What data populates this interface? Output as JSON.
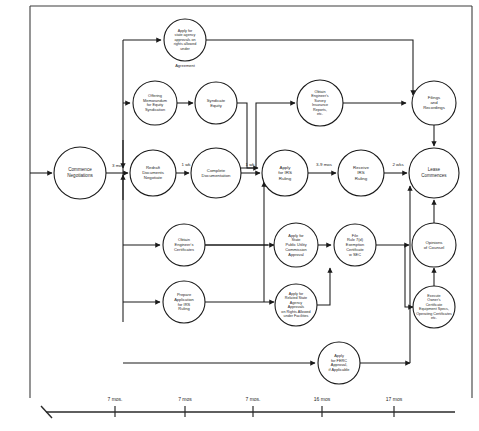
{
  "diagram": {
    "type": "flowchart",
    "nodes": [
      {
        "id": "commence",
        "label": [
          "Commence",
          "Negotiations"
        ],
        "cx": 80,
        "cy": 173,
        "r": 26,
        "font": 4.6
      },
      {
        "id": "redraft",
        "label": [
          "Redraft",
          "Documents",
          "Negotiate"
        ],
        "cx": 153,
        "cy": 173,
        "r": 23,
        "font": 4.3
      },
      {
        "id": "complete_doc",
        "label": [
          "Complete",
          "Documentation"
        ],
        "cx": 216,
        "cy": 173,
        "r": 25,
        "font": 4.3
      },
      {
        "id": "apply_irs",
        "label": [
          "Apply",
          "for IRS",
          "Ruling"
        ],
        "cx": 285,
        "cy": 173,
        "r": 23,
        "font": 4.4
      },
      {
        "id": "receive_irs",
        "label": [
          "Receive",
          "IRS",
          "Ruling"
        ],
        "cx": 361,
        "cy": 173,
        "r": 23,
        "font": 4.4
      },
      {
        "id": "lease_commences",
        "label": [
          "Lease",
          "Commences"
        ],
        "cx": 434,
        "cy": 173,
        "r": 25,
        "font": 4.5
      },
      {
        "id": "state_agency_agreement",
        "label": [
          "Apply for",
          "state agency",
          "approvals on",
          "rights allowed",
          "under"
        ],
        "sublabel": "Agreement",
        "cx": 185,
        "cy": 40,
        "r": 21,
        "font": 3.7
      },
      {
        "id": "offering_memo",
        "label": [
          "Offering",
          "Memorandum",
          "for Equity",
          "Syndication"
        ],
        "cx": 155,
        "cy": 103,
        "r": 22,
        "font": 3.9
      },
      {
        "id": "syndicate_equity",
        "label": [
          "Syndicate",
          "Equity"
        ],
        "cx": 216,
        "cy": 103,
        "r": 21,
        "font": 4.2
      },
      {
        "id": "engineers_survey",
        "label": [
          "Obtain",
          "Engineer's",
          "Survey",
          "Insurance",
          "Reports,",
          "etc."
        ],
        "cx": 320,
        "cy": 103,
        "r": 23,
        "font": 3.7
      },
      {
        "id": "filings_recordings",
        "label": [
          "Filings",
          "and",
          "Recordings"
        ],
        "cx": 434,
        "cy": 103,
        "r": 22,
        "font": 4.3
      },
      {
        "id": "engineers_cert",
        "label": [
          "Obtain",
          "Engineer's",
          "Certificates"
        ],
        "cx": 184,
        "cy": 245,
        "r": 21,
        "font": 4.0
      },
      {
        "id": "prepare_irs",
        "label": [
          "Prepare",
          "Application",
          "for IRS",
          "Ruling"
        ],
        "cx": 184,
        "cy": 302,
        "r": 21,
        "font": 4.0
      },
      {
        "id": "state_puc",
        "label": [
          "Apply for",
          "State",
          "Public Utility",
          "Commission",
          "Approval"
        ],
        "cx": 296,
        "cy": 245,
        "r": 22,
        "font": 3.9
      },
      {
        "id": "rule_7d",
        "label": [
          "File",
          "Rule 7(d)",
          "Exemption",
          "Certificate",
          "w SEC"
        ],
        "cx": 355,
        "cy": 245,
        "r": 21,
        "font": 3.9
      },
      {
        "id": "related_state",
        "label": [
          "Apply for",
          "Related State",
          "Agency",
          "Approvals",
          "on Rights Allowed",
          "under Facilities"
        ],
        "cx": 296,
        "cy": 305,
        "r": 21,
        "font": 3.7
      },
      {
        "id": "ferc",
        "label": [
          "Apply",
          "for FERC",
          "Approval,",
          "if Applicable"
        ],
        "cx": 339,
        "cy": 363,
        "r": 21,
        "font": 3.9
      },
      {
        "id": "opinions",
        "label": [
          "Opinions",
          "of Counsel"
        ],
        "cx": 434,
        "cy": 245,
        "r": 22,
        "font": 4.3
      },
      {
        "id": "owners_cert",
        "label": [
          "Execute",
          "Owner's",
          "Certificate",
          "Equipment Specs,",
          "Operating Certificates",
          "etc."
        ],
        "cx": 434,
        "cy": 307,
        "r": 21,
        "font": 3.7
      }
    ],
    "edge_labels": [
      {
        "id": "three-mos",
        "text": "3 mos",
        "x": 118,
        "y": 167,
        "font": 4.4
      },
      {
        "id": "one-wk-a",
        "text": "1 wk",
        "x": 186,
        "y": 166,
        "font": 4.4
      },
      {
        "id": "one-wk-b",
        "text": "1 wk",
        "x": 250,
        "y": 166,
        "font": 4.4
      },
      {
        "id": "three-nine-mos",
        "text": "3-9 mos",
        "x": 324,
        "y": 166,
        "font": 4.4
      },
      {
        "id": "two-wks",
        "text": "2 wks",
        "x": 398,
        "y": 166,
        "font": 4.4
      }
    ]
  },
  "timeline": {
    "label": "Elapsed time axis",
    "ticks": [
      {
        "id": "tick-1",
        "label": "7 mos.",
        "x": 115
      },
      {
        "id": "tick-2",
        "label": "7  mos",
        "x": 185
      },
      {
        "id": "tick-3",
        "label": "7  mos.",
        "x": 253
      },
      {
        "id": "tick-4",
        "label": "16  mos",
        "x": 322
      },
      {
        "id": "tick-5",
        "label": "17 mos",
        "x": 394
      }
    ]
  },
  "colors": {
    "ink": "#1a1a1a",
    "paper": "#ffffff",
    "frame": "#3d3d3d"
  }
}
